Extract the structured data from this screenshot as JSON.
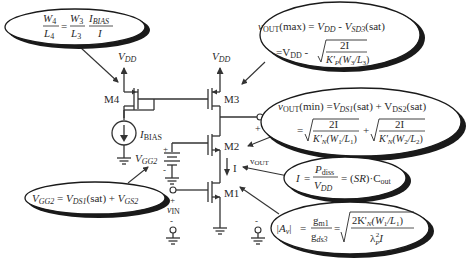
{
  "colors": {
    "ink": "#2a2a2a",
    "background": "#ffffff"
  },
  "circuit": {
    "labels": {
      "vdd_left": "V",
      "vdd_left_sub": "DD",
      "vdd_right": "V",
      "vdd_right_sub": "DD",
      "m4": "M4",
      "m3": "M3",
      "m2": "M2",
      "m1": "M1",
      "ibias": "I",
      "ibias_sub": "BIAS",
      "vgg2": "V",
      "vgg2_sub": "GG2",
      "vin": "v",
      "vin_sub": "IN",
      "vout": "v",
      "vout_sub": "OUT",
      "current": "I",
      "plus": "+",
      "minus": "-"
    }
  },
  "callouts": {
    "ratio": {
      "lhs_num": "W",
      "lhs_num_sub": "4",
      "lhs_den": "L",
      "lhs_den_sub": "4",
      "eq": "=",
      "mid_num": "W",
      "mid_num_sub": "3",
      "mid_den": "L",
      "mid_den_sub": "3",
      "rhs_num": "I",
      "rhs_num_sub": "BIAS",
      "rhs_den": "I"
    },
    "vout_max": {
      "line1_a": "v",
      "line1_a_sub": "OUT",
      "line1_b": "(max) = ",
      "line1_c": "V",
      "line1_c_sub": "DD",
      "line1_d": " - ",
      "line1_e": "V",
      "line1_e_sub": "SD3",
      "line1_f": "(sat)",
      "line2_a": "=V",
      "line2_a_sub": "DD",
      "line2_b": " -",
      "num": "2I",
      "den": "K'",
      "den_sub": "P",
      "den_b": "(W",
      "den_b_sub": "3",
      "den_c": "/L",
      "den_c_sub": "3",
      "den_d": ")"
    },
    "vout_min": {
      "line1_a": "v",
      "line1_a_sub": "OUT",
      "line1_b": "(min) =",
      "line1_c": "V",
      "line1_c_sub": "DS1",
      "line1_d": "(sat) + V",
      "line1_d_sub": "DS2",
      "line1_e": "(sat)",
      "line2_eq": "=",
      "num1": "2I",
      "den1": "K'",
      "den1_sub": "N",
      "den1_b": "(W",
      "den1_b_sub": "1",
      "den1_c": "/L",
      "den1_c_sub": "1",
      "den1_d": ")",
      "plus": "+",
      "num2": "2I",
      "den2": "K'",
      "den2_sub": "N",
      "den2_b": "(W",
      "den2_b_sub": "2",
      "den2_c": "/L",
      "den2_c_sub": "2",
      "den2_d": ")"
    },
    "current": {
      "lhs": "I",
      "eq1": "=",
      "num": "P",
      "num_sub": "diss",
      "den": "V",
      "den_sub": "DD",
      "eq2": "= (",
      "sr": "SR",
      "rest": ")·C",
      "rest_sub": "out"
    },
    "gain": {
      "lhs": "|A",
      "lhs_sub": "v",
      "lhs_end": "|",
      "eq1": "=",
      "num": "g",
      "num_sub": "m1",
      "den": "g",
      "den_sub": "ds3",
      "eq2": "=",
      "rnum": "2K'",
      "rnum_sub": "N",
      "rnum_b": "(W",
      "rnum_b_sub": "1",
      "rnum_c": "/L",
      "rnum_c_sub": "1",
      "rnum_d": ")",
      "rden": "λ",
      "rden_sub": "P",
      "rden_sup": "2",
      "rden_b": "I"
    },
    "vgg2": {
      "a": "V",
      "a_sub": "GG2",
      "b": " = ",
      "c": "V",
      "c_sub": "DS1",
      "d": "(sat) + ",
      "e": "V",
      "e_sub": "GS2"
    }
  }
}
